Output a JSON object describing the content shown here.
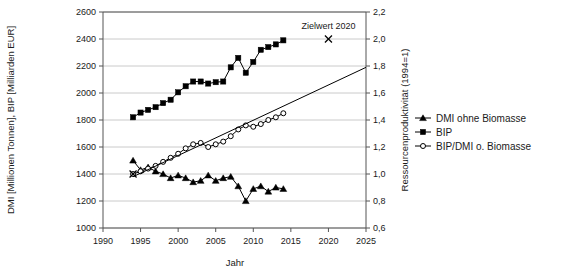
{
  "chart_data": {
    "type": "line",
    "title": "",
    "xlabel": "Jahr",
    "ylabel": "DMI [Millionen Tonnen], BIP [Milliarden EUR]",
    "ylabel_right": "Ressourcenproduktivität (1994=1)",
    "xlim": [
      1990,
      2025
    ],
    "ylim": [
      1000,
      2600
    ],
    "ylim_right": [
      0.6,
      2.2
    ],
    "xticks": [
      1990,
      1995,
      2000,
      2005,
      2010,
      2015,
      2020,
      2025
    ],
    "yticks": [
      1000,
      1200,
      1400,
      1600,
      1800,
      2000,
      2200,
      2400,
      2600
    ],
    "yticks_right": [
      "0,6",
      "0,8",
      "1,0",
      "1,2",
      "1,4",
      "1,6",
      "1,8",
      "2,0",
      "2,2"
    ],
    "grid": true,
    "legend_position": "right",
    "series": [
      {
        "name": "DMI ohne Biomasse",
        "axis": "left",
        "marker": "triangle",
        "x": [
          1994,
          1995,
          1996,
          1997,
          1998,
          1999,
          2000,
          2001,
          2002,
          2003,
          2004,
          2005,
          2006,
          2007,
          2008,
          2009,
          2010,
          2011,
          2012,
          2013,
          2014
        ],
        "values": [
          1500,
          1430,
          1450,
          1420,
          1400,
          1370,
          1390,
          1370,
          1340,
          1350,
          1390,
          1350,
          1370,
          1380,
          1310,
          1200,
          1290,
          1310,
          1270,
          1300,
          1290
        ]
      },
      {
        "name": "BIP",
        "axis": "left",
        "marker": "square",
        "x": [
          1994,
          1995,
          1996,
          1997,
          1998,
          1999,
          2000,
          2001,
          2002,
          2003,
          2004,
          2005,
          2006,
          2007,
          2008,
          2009,
          2010,
          2011,
          2012,
          2013,
          2014
        ],
        "values": [
          1820,
          1855,
          1875,
          1895,
          1925,
          1950,
          2005,
          2050,
          2085,
          2085,
          2070,
          2080,
          2085,
          2190,
          2260,
          2150,
          2230,
          2320,
          2340,
          2360,
          2390
        ]
      },
      {
        "name": "BIP/DMI o. Biomasse",
        "axis": "right",
        "marker": "circle",
        "x": [
          1994,
          1995,
          1996,
          1997,
          1998,
          1999,
          2000,
          2001,
          2002,
          2003,
          2004,
          2005,
          2006,
          2007,
          2008,
          2009,
          2010,
          2011,
          2012,
          2013,
          2014
        ],
        "values": [
          1.0,
          1.02,
          1.04,
          1.06,
          1.09,
          1.12,
          1.15,
          1.19,
          1.22,
          1.23,
          1.2,
          1.22,
          1.24,
          1.28,
          1.33,
          1.36,
          1.35,
          1.37,
          1.4,
          1.42,
          1.45
        ]
      }
    ],
    "trend_line": {
      "name": "trend",
      "axis": "right",
      "x": [
        1994,
        2025
      ],
      "values": [
        0.98,
        1.79
      ]
    },
    "annotations": [
      {
        "name": "zielwert-2020",
        "label": "Zielwert 2020",
        "marker": "x",
        "x": 2020,
        "value": 2.0,
        "axis": "right"
      },
      {
        "name": "basis-1994",
        "label": "",
        "marker": "x",
        "x": 1994,
        "value": 1.0,
        "axis": "right"
      }
    ],
    "legend": [
      {
        "label": "DMI ohne Biomasse",
        "marker": "triangle"
      },
      {
        "label": "BIP",
        "marker": "square"
      },
      {
        "label": "BIP/DMI o. Biomasse",
        "marker": "circle"
      }
    ]
  },
  "colors": {
    "series": "#000000",
    "grid": "#bdbdbd",
    "axis": "#555555",
    "background": "#ffffff"
  }
}
